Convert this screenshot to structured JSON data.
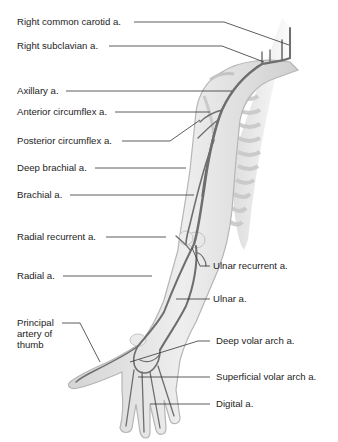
{
  "figure": {
    "colors": {
      "background": "#ffffff",
      "skin": "#e3e3e3",
      "skin_edge": "#b9b9b9",
      "artery": "#6e6e6e",
      "leader": "#333333",
      "text": "#1d1d1d"
    },
    "labels": [
      {
        "id": "right-common-carotid",
        "text": "Right common carotid a.",
        "side": "left"
      },
      {
        "id": "right-subclavian",
        "text": "Right subclavian a.",
        "side": "left"
      },
      {
        "id": "axillary",
        "text": "Axillary a.",
        "side": "left"
      },
      {
        "id": "anterior-circumflex",
        "text": "Anterior circumflex a.",
        "side": "left"
      },
      {
        "id": "posterior-circumflex",
        "text": "Posterior circumflex a.",
        "side": "left"
      },
      {
        "id": "deep-brachial",
        "text": "Deep brachial a.",
        "side": "left"
      },
      {
        "id": "brachial",
        "text": "Brachial a.",
        "side": "left"
      },
      {
        "id": "radial-recurrent",
        "text": "Radial recurrent a.",
        "side": "left"
      },
      {
        "id": "radial",
        "text": "Radial a.",
        "side": "left"
      },
      {
        "id": "principal-artery-thumb",
        "text": "Principal\nartery of\nthumb",
        "side": "left"
      },
      {
        "id": "ulnar-recurrent",
        "text": "Ulnar recurrent a.",
        "side": "right"
      },
      {
        "id": "ulnar",
        "text": "Ulnar a.",
        "side": "right"
      },
      {
        "id": "deep-volar-arch",
        "text": "Deep volar arch a.",
        "side": "right"
      },
      {
        "id": "superficial-volar-arch",
        "text": "Superficial volar arch a.",
        "side": "right"
      },
      {
        "id": "digital",
        "text": "Digital a.",
        "side": "right"
      }
    ]
  }
}
